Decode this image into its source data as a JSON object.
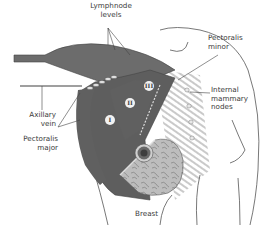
{
  "figure": {
    "labels": {
      "lymphnode_levels": "Lymphnode\nlevels",
      "pectoralis_minor": "Pectoralis\nminor",
      "internal_mammary_nodes": "Internal\nmammary\nnodes",
      "axillary_vein": "Axillary\nvein",
      "pectoralis_major": "Pectoralis\nmajor",
      "breast": "Breast"
    },
    "levels": [
      "I",
      "II",
      "III"
    ],
    "colors": {
      "muscle_dark": "#5e5e5e",
      "muscle_mid": "#8a8a8a",
      "breast_tissue": "#b5b5b5",
      "outline": "#555555",
      "label_text": "#3a3a3a",
      "background": "#ffffff"
    }
  }
}
